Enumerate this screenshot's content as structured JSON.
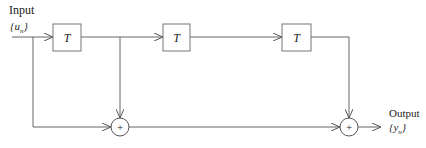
{
  "diagram": {
    "type": "block-diagram",
    "input": {
      "label": "Input",
      "signal": "{u",
      "subscript": "n",
      "close": "}"
    },
    "output": {
      "label": "Output",
      "signal": "{y",
      "subscript": "n",
      "close": "}"
    },
    "delays": [
      {
        "id": "delay-1",
        "label": "T"
      },
      {
        "id": "delay-2",
        "label": "T"
      },
      {
        "id": "delay-3",
        "label": "T"
      }
    ],
    "summers": [
      {
        "id": "sum-1",
        "symbol": "+"
      },
      {
        "id": "sum-2",
        "symbol": "+"
      }
    ],
    "connections": [
      "input -> delay-1",
      "delay-1 -> delay-2",
      "delay-2 -> delay-3",
      "input -> sum-1",
      "delay-1 output -> sum-1",
      "sum-1 -> sum-2",
      "delay-3 -> sum-2",
      "sum-2 -> output"
    ]
  }
}
